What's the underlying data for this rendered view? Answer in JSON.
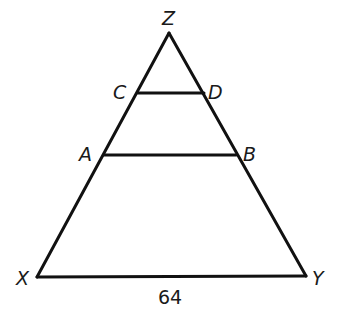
{
  "diagram": {
    "type": "geometry-triangle",
    "points": {
      "Z": {
        "x": 169,
        "y": 33
      },
      "C": {
        "x": 138,
        "y": 93
      },
      "D": {
        "x": 204,
        "y": 93
      },
      "A": {
        "x": 104,
        "y": 155
      },
      "B": {
        "x": 236,
        "y": 155
      },
      "X": {
        "x": 37,
        "y": 277
      },
      "Y": {
        "x": 306,
        "y": 276
      }
    },
    "segments": [
      {
        "from": "X",
        "to": "Z"
      },
      {
        "from": "Z",
        "to": "Y"
      },
      {
        "from": "X",
        "to": "Y"
      },
      {
        "from": "C",
        "to": "D"
      },
      {
        "from": "A",
        "to": "B"
      }
    ],
    "labels": {
      "Z": "Z",
      "C": "C",
      "D": "D",
      "A": "A",
      "B": "B",
      "X": "X",
      "Y": "Y"
    },
    "measurements": {
      "XY": "64"
    }
  }
}
